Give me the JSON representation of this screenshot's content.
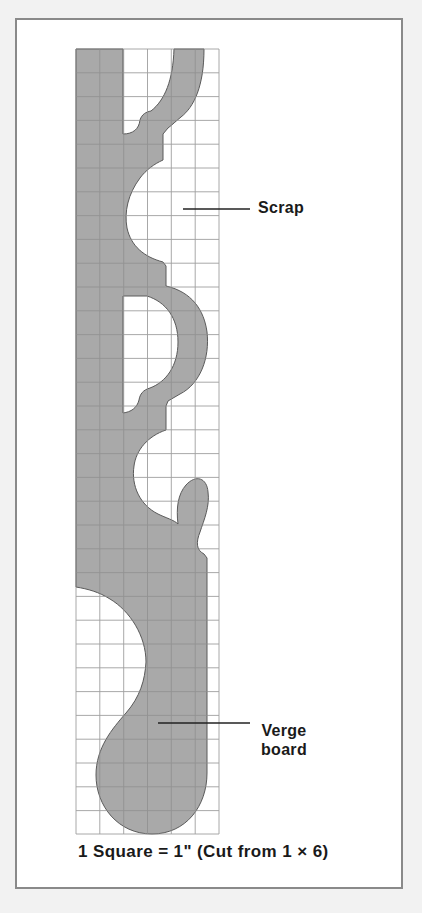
{
  "diagram": {
    "type": "cutting-pattern",
    "grid": {
      "columns": 6,
      "rows": 33,
      "unit": "1 inch per square"
    },
    "colors": {
      "piece_fill": "#a9a9a9",
      "piece_outline": "#555555",
      "grid_line": "#9a9a9a",
      "frame_border": "#8a8a8a",
      "page_background": "#f2f2f2"
    },
    "labels": {
      "scrap": "Scrap",
      "verge_line1": "Verge",
      "verge_line2": "board"
    },
    "caption": "1 Square = 1\" (Cut from 1 × 6)"
  }
}
